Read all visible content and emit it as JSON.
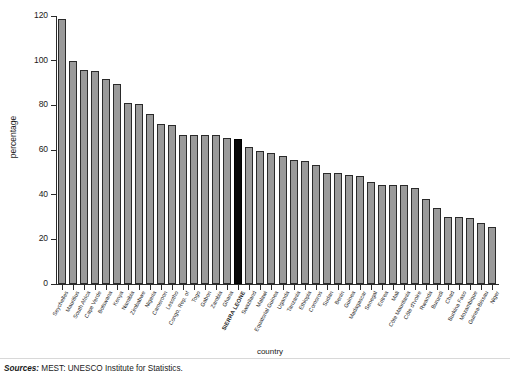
{
  "chart_data": {
    "type": "bar",
    "title": "",
    "xlabel": "country",
    "ylabel": "percentage",
    "ylim": [
      0,
      120
    ],
    "yticks": [
      0,
      20,
      40,
      60,
      80,
      100,
      120
    ],
    "grid": false,
    "legend": null,
    "highlight_category": "SIERRA LEONE",
    "highlight_color": "#080808",
    "bar_color": "#9a9a9a",
    "bar_edge_color": "#2a2a2a",
    "categories": [
      "Seychelles",
      "Mauritius",
      "South Africa",
      "Cape Verde",
      "Botswana",
      "Kenya",
      "Namibia",
      "Zimbabwe",
      "Nigeria",
      "Cameroon",
      "Lesotho",
      "Congo, Rep. of",
      "Togo",
      "Gabon",
      "Zambia",
      "Ghana",
      "SIERRA LEONE",
      "Swaziland",
      "Malawi",
      "Equatorial Guinea",
      "Uganda",
      "Tanzania",
      "Ethiopia",
      "Comoros",
      "Sudan",
      "Benin",
      "Guinea",
      "Madagascar",
      "Senegal",
      "Eritrea",
      "Mali",
      "Côte Mauritania",
      "Côte d'Ivoire",
      "Rwanda",
      "Burundi",
      "Chad",
      "Burkina Faso",
      "Mozambique",
      "Guinea-Bissau",
      "Niger"
    ],
    "values": [
      118.5,
      100.0,
      96.0,
      95.5,
      92.0,
      89.5,
      81.0,
      80.5,
      76.0,
      71.5,
      71.0,
      66.5,
      66.5,
      66.5,
      66.5,
      65.5,
      65.0,
      61.5,
      59.5,
      58.5,
      57.5,
      55.5,
      55.0,
      53.5,
      49.5,
      49.5,
      49.0,
      48.5,
      45.5,
      44.5,
      44.5,
      44.5,
      43.0,
      38.0,
      34.0,
      30.0,
      30.0,
      29.5,
      27.5,
      25.5
    ]
  },
  "footer": {
    "source_label": "Sources:",
    "source_text": "MEST: UNESCO Institute for Statistics."
  }
}
